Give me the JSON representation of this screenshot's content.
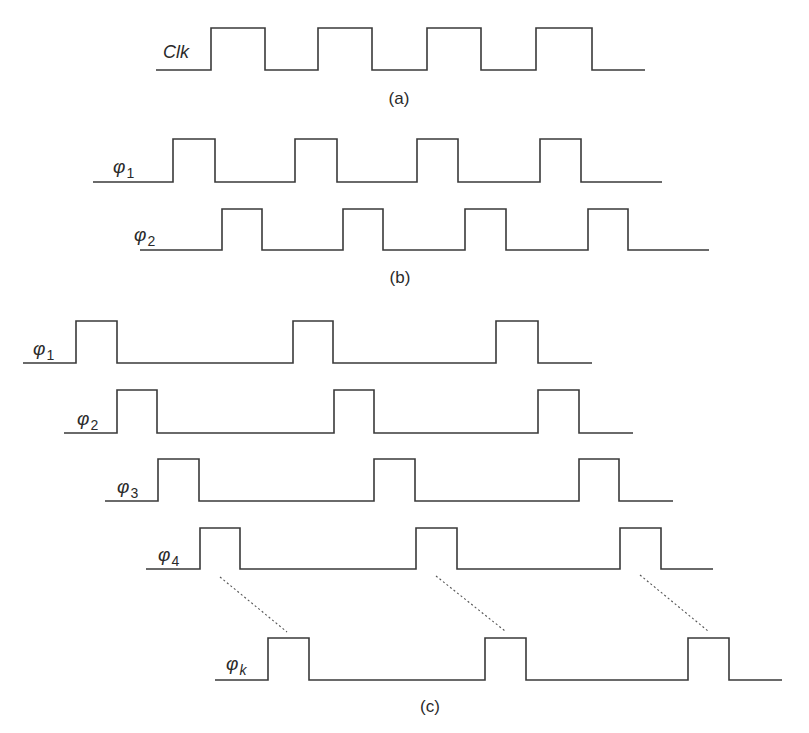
{
  "figure": {
    "colors": {
      "stroke": "#3a3a3a",
      "background": "#ffffff"
    },
    "panels": [
      {
        "id": "a",
        "label": "(a)",
        "label_pos": [
          399,
          104
        ],
        "signals": [
          {
            "name": "Clk",
            "label_main": "Clk",
            "label_sub": "",
            "label_pos": [
              163,
              58
            ],
            "low_y": 70,
            "high_y": 28,
            "start_x": 156,
            "end_x": 645,
            "pulses": [
              [
                211,
                265
              ],
              [
                318,
                372
              ],
              [
                427,
                481
              ],
              [
                536,
                592
              ]
            ]
          }
        ]
      },
      {
        "id": "b",
        "label": "(b)",
        "label_pos": [
          400,
          283
        ],
        "signals": [
          {
            "name": "phi1",
            "label_main": "φ",
            "label_sub": "1",
            "label_pos": [
              113,
              173
            ],
            "low_y": 182,
            "high_y": 139,
            "start_x": 93,
            "end_x": 662,
            "pulses": [
              [
                173,
                215
              ],
              [
                295,
                337
              ],
              [
                417,
                458
              ],
              [
                540,
                581
              ]
            ]
          },
          {
            "name": "phi2",
            "label_main": "φ",
            "label_sub": "2",
            "label_pos": [
              134,
              241
            ],
            "low_y": 250,
            "high_y": 209,
            "start_x": 140,
            "end_x": 709,
            "pulses": [
              [
                222,
                262
              ],
              [
                343,
                383
              ],
              [
                465,
                506
              ],
              [
                588,
                628
              ]
            ]
          }
        ]
      },
      {
        "id": "c",
        "label": "(c)",
        "label_pos": [
          430,
          712
        ],
        "signals": [
          {
            "name": "phi1",
            "label_main": "φ",
            "label_sub": "1",
            "label_pos": [
              33,
              355
            ],
            "low_y": 363,
            "high_y": 321,
            "start_x": 23,
            "end_x": 592,
            "pulses": [
              [
                76,
                117
              ],
              [
                293,
                333
              ],
              [
                496,
                538
              ]
            ]
          },
          {
            "name": "phi2",
            "label_main": "φ",
            "label_sub": "2",
            "label_pos": [
              77,
              425
            ],
            "low_y": 433,
            "high_y": 390,
            "start_x": 64,
            "end_x": 633,
            "pulses": [
              [
                117,
                157
              ],
              [
                334,
                374
              ],
              [
                538,
                579
              ]
            ]
          },
          {
            "name": "phi3",
            "label_main": "φ",
            "label_sub": "3",
            "label_pos": [
              117,
              493
            ],
            "low_y": 501,
            "high_y": 459,
            "start_x": 105,
            "end_x": 673,
            "pulses": [
              [
                158,
                199
              ],
              [
                374,
                415
              ],
              [
                579,
                619
              ]
            ]
          },
          {
            "name": "phi4",
            "label_main": "φ",
            "label_sub": "4",
            "label_pos": [
              158,
              561
            ],
            "low_y": 569,
            "high_y": 528,
            "start_x": 146,
            "end_x": 713,
            "pulses": [
              [
                200,
                240
              ],
              [
                416,
                457
              ],
              [
                620,
                661
              ]
            ]
          },
          {
            "name": "phik",
            "label_main": "φ",
            "label_sub": "k",
            "label_pos": [
              226,
              670
            ],
            "low_y": 680,
            "high_y": 638,
            "start_x": 215,
            "end_x": 782,
            "pulses": [
              [
                268,
                309
              ],
              [
                485,
                526
              ],
              [
                688,
                729
              ]
            ]
          }
        ],
        "ellipsis_lines": [
          [
            [
              220,
              577
            ],
            [
              287,
              632
            ]
          ],
          [
            [
              436,
              576
            ],
            [
              505,
              631
            ]
          ],
          [
            [
              640,
              575
            ],
            [
              708,
              631
            ]
          ]
        ]
      }
    ]
  }
}
